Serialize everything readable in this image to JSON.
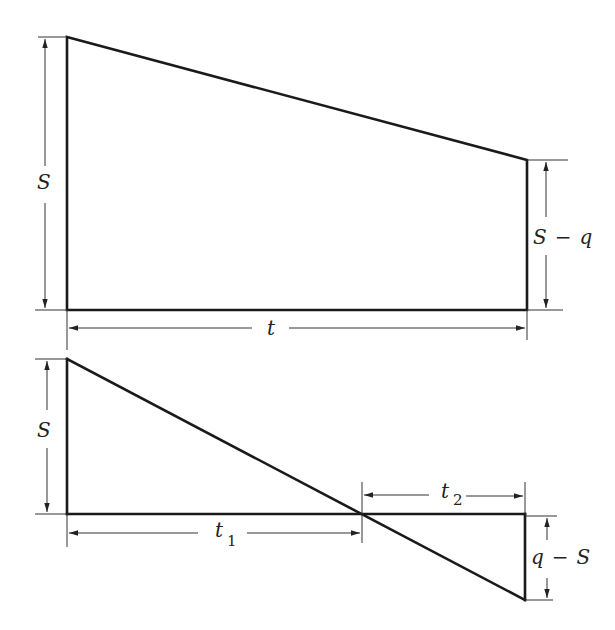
{
  "figure": {
    "top_panel": {
      "description": "Trapezoid: height S at left, height S - q at right, width t",
      "labels": {
        "left_height": "S",
        "right_height_a": "S",
        "right_height_op": "−",
        "right_height_b": "q",
        "width": "t"
      }
    },
    "bottom_panel": {
      "description": "Line from S above axis at left, crossing axis after t1, reaching q - S below axis at right after t2",
      "labels": {
        "left_height": "S",
        "t1_base": "t",
        "t1_sub": "1",
        "t2_base": "t",
        "t2_sub": "2",
        "right_depth_a": "q",
        "right_depth_op": "−",
        "right_depth_b": "S"
      }
    }
  },
  "colors": {
    "line": "#1a1a1a",
    "background": "#ffffff"
  }
}
